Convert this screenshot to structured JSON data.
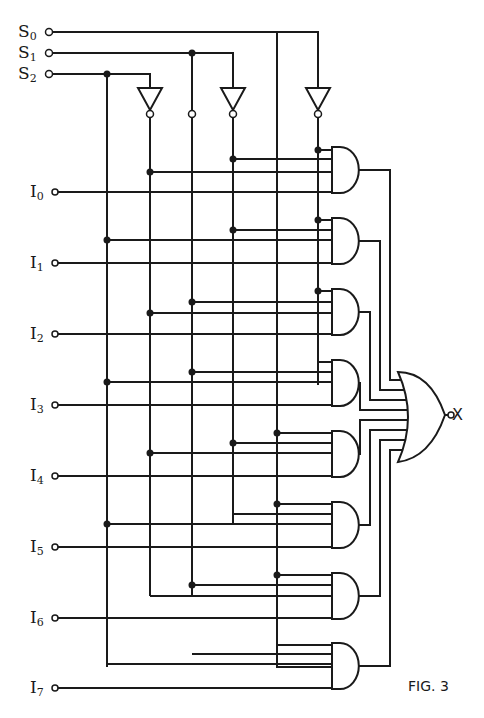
{
  "figure": {
    "caption": "FIG. 3",
    "type": "8-to-1 multiplexer logic diagram"
  },
  "select_inputs": [
    {
      "name": "S",
      "sub": "0",
      "y": 32
    },
    {
      "name": "S",
      "sub": "1",
      "y": 53
    },
    {
      "name": "S",
      "sub": "2",
      "y": 74
    }
  ],
  "data_inputs": [
    {
      "name": "I",
      "sub": "0",
      "y": 192
    },
    {
      "name": "I",
      "sub": "1",
      "y": 263
    },
    {
      "name": "I",
      "sub": "2",
      "y": 334
    },
    {
      "name": "I",
      "sub": "3",
      "y": 405
    },
    {
      "name": "I",
      "sub": "4",
      "y": 476
    },
    {
      "name": "I",
      "sub": "5",
      "y": 547
    },
    {
      "name": "I",
      "sub": "6",
      "y": 618
    },
    {
      "name": "I",
      "sub": "7",
      "y": 688
    }
  ],
  "output": {
    "name": "X"
  },
  "gates": {
    "inverters": 3,
    "and_gates": 8,
    "or_gates": 1
  }
}
